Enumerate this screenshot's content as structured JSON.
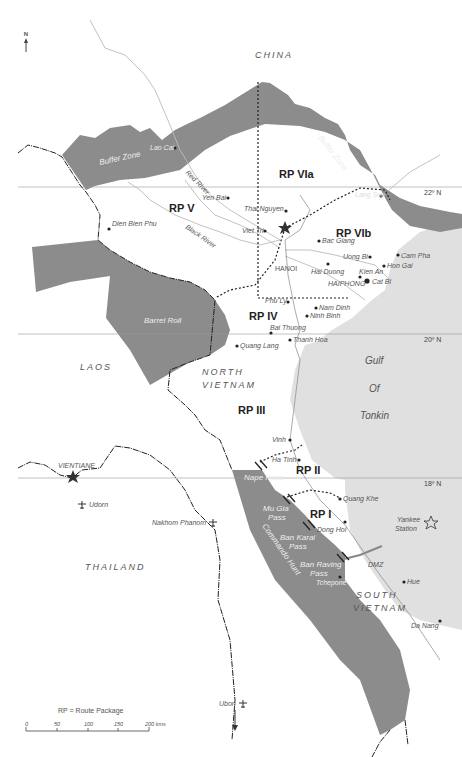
{
  "map": {
    "north_arrow": "N",
    "countries": {
      "china": "CHINA",
      "laos": "LAOS",
      "north_vietnam_1": "NORTH",
      "north_vietnam_2": "VIETNAM",
      "thailand": "THAILAND",
      "south_vietnam_1": "SOUTH",
      "south_vietnam_2": "VIETNAM"
    },
    "route_packages": {
      "rp1": "RP I",
      "rp2": "RP II",
      "rp3": "RP III",
      "rp4": "RP IV",
      "rp5": "RP V",
      "rp6a": "RP VIa",
      "rp6b": "RP VIb"
    },
    "zones": {
      "buffer_west": "Buffer Zone",
      "buffer_east": "Buffer Zone",
      "barrel_roll": "Barrel Roll",
      "commando_hunt": "Commando Hunt"
    },
    "sea": {
      "gulf_1": "Gulf",
      "gulf_2": "Of",
      "gulf_3": "Tonkin",
      "yankee_1": "Yankee",
      "yankee_2": "Station"
    },
    "rivers": {
      "red": "Red River",
      "black": "Black River"
    },
    "latitudes": {
      "lat22": "22º N",
      "lat20": "20º N",
      "lat18": "18º N"
    },
    "cities": {
      "lao_cai": "Lao Cai",
      "yen_bai": "Yen Bai",
      "dien_bien_phu": "Dien Bien Phu",
      "thai_nguyen": "Thai Nguyen",
      "viet_tri": "Viet Tri",
      "lang_son": "Lang Son",
      "bac_giang": "Bac Giang",
      "hanoi": "HANOI",
      "uong_bi": "Uong Bi",
      "cam_pha": "Cam Pha",
      "hon_gai": "Hon Gai",
      "hai_duong": "Hai Duong",
      "kien_an": "Kien An",
      "haiphong": "HAIPHONG",
      "cat_bi": "Cat Bi",
      "phu_ly": "Phu Ly",
      "nam_dinh": "Nam Dinh",
      "ninh_binh": "Ninh Binh",
      "bai_thuong": "Bai Thuong",
      "thanh_hoa": "Thanh Hoa",
      "quang_lang": "Quang Lang",
      "vinh": "Vinh",
      "ha_tinh": "Ha Tinh",
      "quang_khe": "Quang Khe",
      "dong_hoi": "Dong Hoi",
      "tchepone": "Tchepone",
      "hue": "Hue",
      "da_nang": "Da Nang",
      "vientiane": "VIENTIANE",
      "udorn": "Udorn",
      "nakhom_phanom": "Nakhom Phanom",
      "ubon": "Ubon"
    },
    "passes": {
      "nape": "Nape Pass",
      "mu_gia_1": "Mu Gia",
      "mu_gia_2": "Pass",
      "ban_karai_1": "Ban Karai",
      "ban_karai_2": "Pass",
      "ban_raving_1": "Ban Raving",
      "ban_raving_2": "Pass"
    },
    "dmz": "DMZ",
    "legend": {
      "rp_note": "RP = Route Package",
      "scale_ticks": [
        "0",
        "50",
        "100",
        "150",
        "200 kms"
      ]
    },
    "colors": {
      "zone_fill": "#8c8c8c",
      "sea_fill": "#e0e0e0",
      "border": "#222222",
      "river": "#bbbbbb",
      "latitude": "#999999"
    }
  }
}
